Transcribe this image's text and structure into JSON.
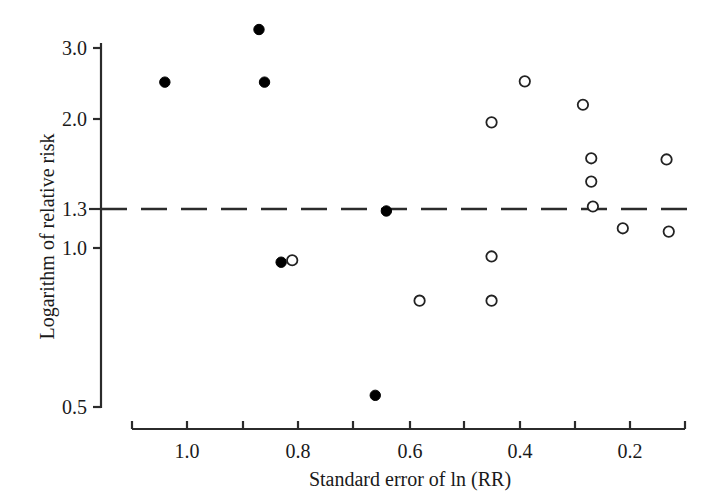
{
  "chart_data": {
    "type": "scatter",
    "title": "",
    "xlabel": "Standard error of ln (RR)",
    "ylabel": "Logarithm of relative risk",
    "x_tick_labels": [
      "1.0",
      "0.8",
      "0.6",
      "0.4",
      "0.2"
    ],
    "x_tick_values": [
      1.0,
      0.8,
      0.6,
      0.4,
      0.2
    ],
    "x_minor_tick_values": [
      1.1,
      0.9,
      0.7,
      0.5,
      0.3,
      0.1
    ],
    "xlim": [
      1.12,
      0.08
    ],
    "x_axis_reversed": true,
    "y_tick_labels": [
      "3.0",
      "2.0",
      "1.3",
      "1.0",
      "0.5"
    ],
    "y_tick_values": [
      3.0,
      2.0,
      1.3,
      1.0,
      0.5
    ],
    "ylim": [
      0.5,
      3.0
    ],
    "y_scale": "log",
    "grid": false,
    "legend_position": "none",
    "reference_line": {
      "value": 1.3,
      "style": "dashed",
      "orientation": "horizontal",
      "label": "1.3"
    },
    "series": [
      {
        "name": "filled",
        "marker": "filled-circle",
        "color": "#000000",
        "points": [
          {
            "x": 0.87,
            "y": 3.29
          },
          {
            "x": 1.04,
            "y": 2.53
          },
          {
            "x": 0.86,
            "y": 2.53
          },
          {
            "x": 0.83,
            "y": 1.03
          },
          {
            "x": 0.64,
            "y": 1.33
          },
          {
            "x": 0.66,
            "y": 0.53
          }
        ]
      },
      {
        "name": "open",
        "marker": "open-circle",
        "color": "#222222",
        "points": [
          {
            "x": 0.81,
            "y": 1.04
          },
          {
            "x": 0.58,
            "y": 0.85
          },
          {
            "x": 0.45,
            "y": 1.06
          },
          {
            "x": 0.45,
            "y": 0.85
          },
          {
            "x": 0.45,
            "y": 2.07
          },
          {
            "x": 0.39,
            "y": 2.54
          },
          {
            "x": 0.285,
            "y": 2.26
          },
          {
            "x": 0.27,
            "y": 1.73
          },
          {
            "x": 0.27,
            "y": 1.54
          },
          {
            "x": 0.267,
            "y": 1.36
          },
          {
            "x": 0.213,
            "y": 1.22
          },
          {
            "x": 0.134,
            "y": 1.72
          },
          {
            "x": 0.13,
            "y": 1.2
          }
        ]
      }
    ]
  },
  "axes": {
    "y_title": "Logarithm of relative risk",
    "x_title": "Standard error of ln (RR)",
    "y_ticks": [
      {
        "label": "3.0",
        "py": 48
      },
      {
        "label": "2.0",
        "py": 119
      },
      {
        "label": "1.3",
        "py": 209
      },
      {
        "label": "1.0",
        "py": 248
      },
      {
        "label": "0.5",
        "py": 407
      }
    ],
    "x_ticks": [
      {
        "label": "",
        "px": 132
      },
      {
        "label": "1.0",
        "px": 187
      },
      {
        "label": "",
        "px": 243
      },
      {
        "label": "0.8",
        "px": 298
      },
      {
        "label": "",
        "px": 353
      },
      {
        "label": "0.6",
        "px": 410
      },
      {
        "label": "",
        "px": 464
      },
      {
        "label": "0.4",
        "px": 520
      },
      {
        "label": "",
        "px": 575
      },
      {
        "label": "0.2",
        "px": 630
      },
      {
        "label": "",
        "px": 685
      }
    ]
  },
  "geometry": {
    "y_axis_x": 101,
    "y_axis_top": 43,
    "y_axis_bottom": 408,
    "x_axis_y": 429,
    "x_axis_left": 132,
    "x_axis_right": 685,
    "tick_len": 8,
    "marker_radius": 5.2,
    "dash_y": 209,
    "dash_x_start": 101,
    "dash_x_end": 690
  },
  "style": {
    "axis_color": "#2b2b2b",
    "marker_fill": "#000000",
    "marker_stroke": "#222222",
    "background": "#ffffff"
  }
}
